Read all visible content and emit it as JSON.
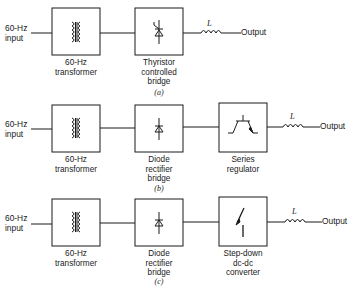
{
  "diagrams": [
    {
      "caption": "(a)",
      "input_label": "60-Hz\ninput",
      "blocks": [
        {
          "symbol": "transformer-icon",
          "label": "60-Hz\ntransformer"
        },
        {
          "symbol": "thyristor-icon",
          "label": "Thyristor\ncontrolled\nbridge"
        }
      ],
      "inductor_label": "L",
      "output_label": "Output"
    },
    {
      "caption": "(b)",
      "input_label": "60-Hz\ninput",
      "blocks": [
        {
          "symbol": "transformer-icon",
          "label": "60-Hz\ntransformer"
        },
        {
          "symbol": "diode-icon",
          "label": "Diode\nrectifier\nbridge"
        },
        {
          "symbol": "transistor-icon",
          "label": "Series\nregulator"
        }
      ],
      "inductor_label": "L",
      "output_label": "Output"
    },
    {
      "caption": "(c)",
      "input_label": "60-Hz\ninput",
      "blocks": [
        {
          "symbol": "transformer-icon",
          "label": "60-Hz\ntransformer"
        },
        {
          "symbol": "diode-icon",
          "label": "Diode\nrectifier\nbridge"
        },
        {
          "symbol": "switch-icon",
          "label": "Step-down\ndc-dc\nconverter"
        }
      ],
      "inductor_label": "L",
      "output_label": "Output"
    }
  ]
}
